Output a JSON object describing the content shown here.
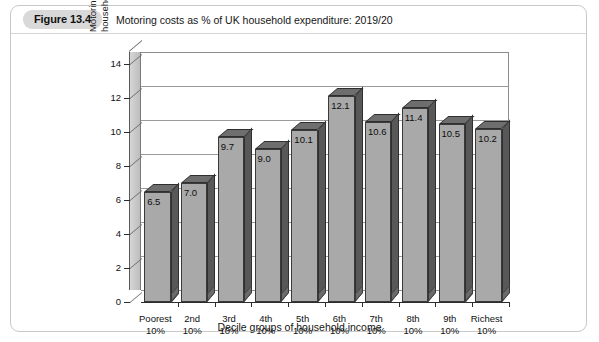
{
  "figure": {
    "number_label": "Figure 13.4",
    "title": "Motoring costs as % of UK household expenditure: 2019/20"
  },
  "chart_data": {
    "type": "bar",
    "title": "Motoring costs as % of UK household expenditure: 2019/20",
    "xlabel": "Decile groups of household income",
    "ylabel": "Motoring costs as % of household expenditure",
    "ylabel_line1": "Motoring costs as % of",
    "ylabel_line2": "household expenditure",
    "categories": [
      "Poorest 10%",
      "2nd 10%",
      "3rd 10%",
      "4th 10%",
      "5th 10%",
      "6th 10%",
      "7th 10%",
      "8th 10%",
      "9th 10%",
      "Richest 10%"
    ],
    "category_lines": [
      [
        "Poorest",
        "10%"
      ],
      [
        "2nd",
        "10%"
      ],
      [
        "3rd",
        "10%"
      ],
      [
        "4th",
        "10%"
      ],
      [
        "5th",
        "10%"
      ],
      [
        "6th",
        "10%"
      ],
      [
        "7th",
        "10%"
      ],
      [
        "8th",
        "10%"
      ],
      [
        "9th",
        "10%"
      ],
      [
        "Richest",
        "10%"
      ]
    ],
    "values": [
      6.5,
      7.0,
      9.7,
      9.0,
      10.1,
      12.1,
      10.6,
      11.4,
      10.5,
      10.2
    ],
    "value_labels": [
      "6.5",
      "7.0",
      "9.7",
      "9.0",
      "10.1",
      "12.1",
      "10.6",
      "11.4",
      "10.5",
      "10.2"
    ],
    "ylim": [
      0,
      14
    ],
    "yticks": [
      0,
      2,
      4,
      6,
      8,
      10,
      12,
      14
    ],
    "ytick_labels": [
      "0",
      "2",
      "4",
      "6",
      "8",
      "10",
      "12",
      "14"
    ],
    "grid": true,
    "legend": "none",
    "style": "3d-column",
    "colors": {
      "bar_front": "#a9a9a9",
      "bar_top": "#6e6e6e",
      "bar_side": "#585858",
      "gridline": "#9a9a9a",
      "axis": "#2c2c2c",
      "pill_background": "#d9d9d9",
      "card_border": "#c9c9c9",
      "text": "#101010"
    }
  }
}
